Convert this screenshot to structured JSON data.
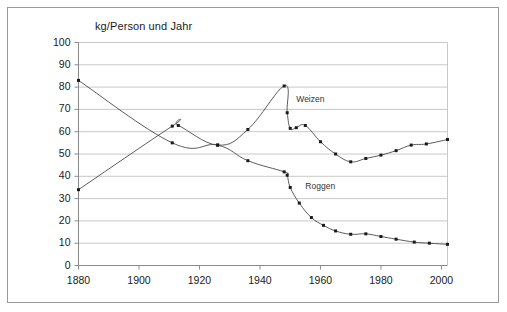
{
  "figure": {
    "axis_title": "kg/Person und Jahr",
    "frame_color": "#9a9a9a",
    "grid_color": "#c8c8c8",
    "line_color": "#4a4a4a",
    "marker_color": "#1a1a1a",
    "background": "#ffffff"
  },
  "chart_data": {
    "type": "line",
    "title": "",
    "subtitle": "",
    "xlabel": "",
    "ylabel": "kg/Person und Jahr",
    "xlim": [
      1880,
      2002
    ],
    "ylim": [
      0,
      100
    ],
    "xticks": [
      1880,
      1900,
      1920,
      1940,
      1960,
      1980,
      2000
    ],
    "yticks": [
      0,
      10,
      20,
      30,
      40,
      50,
      60,
      70,
      80,
      90,
      100
    ],
    "grid": "horizontal",
    "legend": "inline-annotation",
    "annotations": [
      {
        "text": "Weizen",
        "x": 1952,
        "y": 74
      },
      {
        "text": "Roggen",
        "x": 1955,
        "y": 35
      }
    ],
    "series": [
      {
        "name": "Weizen",
        "points": [
          [
            1880,
            34.0
          ],
          [
            1911,
            62.5
          ],
          [
            1913,
            62.8
          ],
          [
            1926,
            54.0
          ],
          [
            1936,
            61.0
          ],
          [
            1948,
            80.5
          ],
          [
            1949,
            68.5
          ],
          [
            1950,
            61.5
          ],
          [
            1952,
            61.8
          ],
          [
            1955,
            62.8
          ],
          [
            1960,
            55.5
          ],
          [
            1965,
            50.0
          ],
          [
            1970,
            46.5
          ],
          [
            1975,
            48.0
          ],
          [
            1980,
            49.5
          ],
          [
            1985,
            51.5
          ],
          [
            1990,
            54.0
          ],
          [
            1995,
            54.5
          ],
          [
            2002,
            56.5
          ]
        ]
      },
      {
        "name": "Roggen",
        "points": [
          [
            1880,
            83.0
          ],
          [
            1911,
            55.0
          ],
          [
            1926,
            54.0
          ],
          [
            1936,
            47.0
          ],
          [
            1948,
            42.0
          ],
          [
            1949,
            40.5
          ],
          [
            1950,
            35.0
          ],
          [
            1953,
            28.0
          ],
          [
            1957,
            21.5
          ],
          [
            1961,
            18.0
          ],
          [
            1965,
            15.5
          ],
          [
            1970,
            14.0
          ],
          [
            1975,
            14.2
          ],
          [
            1980,
            13.0
          ],
          [
            1985,
            11.8
          ],
          [
            1991,
            10.5
          ],
          [
            1996,
            10.0
          ],
          [
            2002,
            9.5
          ]
        ]
      }
    ]
  }
}
